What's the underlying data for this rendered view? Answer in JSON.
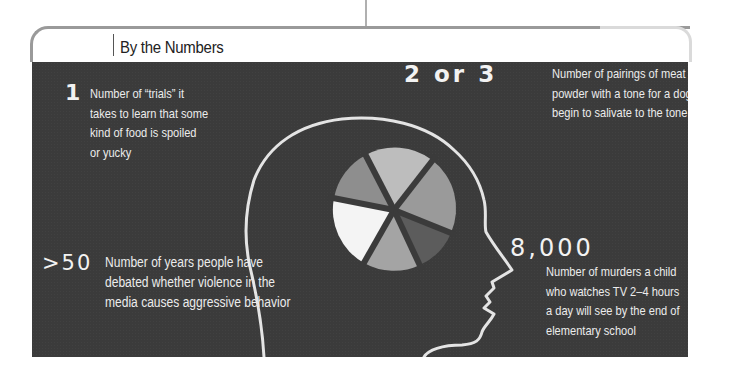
{
  "section": {
    "title": "By the Numbers"
  },
  "facts": [
    {
      "value": "1",
      "lines": [
        "Number of “trials” it",
        "takes to learn that some",
        "kind of food is spoiled",
        "or yucky"
      ]
    },
    {
      "value": "2 or 3",
      "lines": [
        "Number of pairings of meat",
        "powder with a tone for a dog to",
        "begin to salivate to the tone alone"
      ]
    },
    {
      "value": ">50",
      "lines": [
        "Number of years people have",
        "debated whether violence in the",
        "media causes aggressive behavior"
      ]
    },
    {
      "value": "8,000",
      "lines": [
        "Number of murders a child",
        "who watches TV 2–4 hours",
        "a day will see by the end of",
        "elementary school"
      ]
    }
  ],
  "illustration": {
    "description": "chalk outline of a head profile containing a segmented pie",
    "pie_slice_colors": [
      "#b9b9b9",
      "#9c9c9c",
      "#7a7a7a",
      "#555555",
      "#a6a6a6",
      "#f5f5f5",
      "#8f8f8f"
    ]
  },
  "colors": {
    "panel": "#3b3b3b",
    "chalk": "#e8e8e8",
    "frame": "#9a9a9a"
  }
}
